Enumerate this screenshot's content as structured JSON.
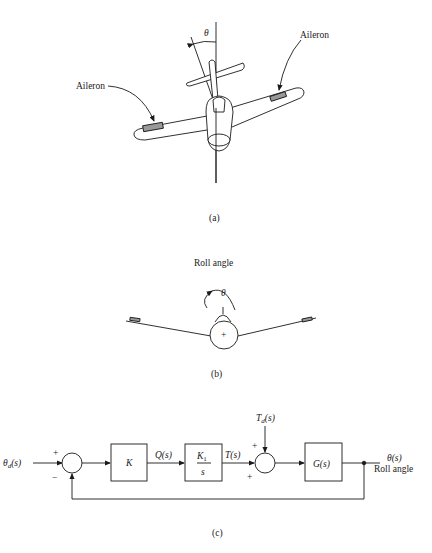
{
  "figure": {
    "panel_a": {
      "caption": "(a)",
      "angle_symbol": "θ",
      "left_label": "Aileron",
      "right_label": "Aileron"
    },
    "panel_b": {
      "caption": "(b)",
      "title": "Roll angle",
      "angle_symbol": "θ",
      "center_mark": "+"
    },
    "panel_c": {
      "caption": "(c)",
      "input": "θ",
      "input_sub": "d",
      "input_arg": "(s)",
      "sum1_plus": "+",
      "sum1_minus": "−",
      "block_K": "K",
      "signal_Q": "Q(s)",
      "block_K1_num": "K",
      "block_K1_num_sub": "1",
      "block_K1_den": "s",
      "signal_T": "T(s)",
      "disturbance": "T",
      "disturbance_sub": "d",
      "disturbance_arg": "(s)",
      "sum2_plus_top": "+",
      "sum2_plus_bottom": "+",
      "block_G": "G(s)",
      "output": "θ(s)",
      "output_label": "Roll angle"
    }
  }
}
